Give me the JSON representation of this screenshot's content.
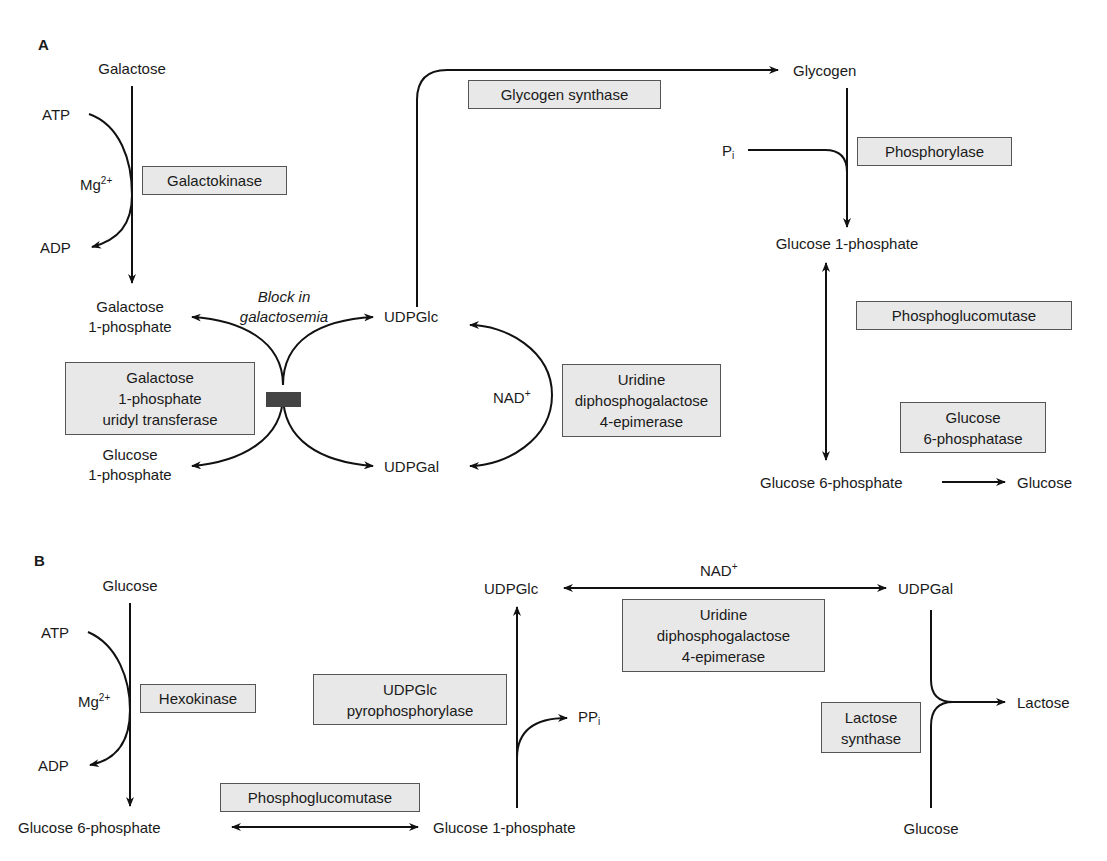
{
  "panel_a": {
    "label": "A",
    "galactose": "Galactose",
    "atp": "ATP",
    "mg": "Mg",
    "mg_sup": "2+",
    "adp": "ADP",
    "galactokinase": "Galactokinase",
    "gal1p_l1": "Galactose",
    "gal1p_l2": "1-phosphate",
    "block_l1": "Block in",
    "block_l2": "galactosemia",
    "transferase_l1": "Galactose",
    "transferase_l2": "1-phosphate",
    "transferase_l3": "uridyl transferase",
    "glc1p_l1": "Glucose",
    "glc1p_l2": "1-phosphate",
    "udpglc": "UDPGlc",
    "udpgal": "UDPGal",
    "nad": "NAD",
    "nad_sup": "+",
    "epimerase_l1": "Uridine",
    "epimerase_l2": "diphosphogalactose",
    "epimerase_l3": "4-epimerase",
    "glycogen_synthase": "Glycogen synthase",
    "glycogen": "Glycogen",
    "pi": "P",
    "pi_sub": "i",
    "phosphorylase": "Phosphorylase",
    "glucose_1p": "Glucose 1-phosphate",
    "phosphoglucomutase": "Phosphoglucomutase",
    "g6pase_l1": "Glucose",
    "g6pase_l2": "6-phosphatase",
    "glucose_6p": "Glucose 6-phosphate",
    "glucose": "Glucose"
  },
  "panel_b": {
    "label": "B",
    "glucose": "Glucose",
    "atp": "ATP",
    "mg": "Mg",
    "mg_sup": "2+",
    "adp": "ADP",
    "hexokinase": "Hexokinase",
    "glucose_6p": "Glucose 6-phosphate",
    "phosphoglucomutase": "Phosphoglucomutase",
    "glucose_1p": "Glucose 1-phosphate",
    "pyrophosphorylase_l1": "UDPGlc",
    "pyrophosphorylase_l2": "pyrophosphorylase",
    "ppi": "PP",
    "ppi_sub": "i",
    "udpglc": "UDPGlc",
    "nad": "NAD",
    "nad_sup": "+",
    "udpgal": "UDPGal",
    "epimerase_l1": "Uridine",
    "epimerase_l2": "diphosphogalactose",
    "epimerase_l3": "4-epimerase",
    "lactose_synthase_l1": "Lactose",
    "lactose_synthase_l2": "synthase",
    "lactose": "Lactose",
    "glucose_bottom": "Glucose"
  }
}
